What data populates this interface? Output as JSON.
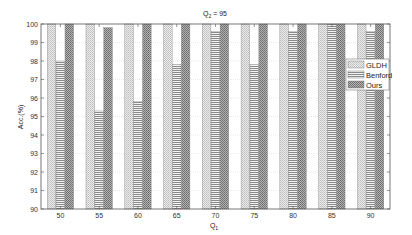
{
  "chart_data": {
    "type": "bar",
    "title": "Q2 = 95",
    "title_main": "Q",
    "title_sub": "2",
    "title_rest": " = 95",
    "xlabel": "Q1",
    "xlabel_main": "Q",
    "xlabel_sub": "1",
    "ylabel": "Acc.(%)",
    "categories": [
      "50",
      "55",
      "60",
      "65",
      "70",
      "75",
      "80",
      "85",
      "90"
    ],
    "series": [
      {
        "name": "GLDH",
        "pattern": "light-checker",
        "values": [
          100,
          100,
          100,
          100,
          100,
          100,
          100,
          100,
          100
        ]
      },
      {
        "name": "Benford",
        "pattern": "horizontal-lines",
        "values": [
          98.0,
          95.3,
          95.8,
          97.8,
          99.6,
          97.8,
          99.6,
          100,
          99.6
        ]
      },
      {
        "name": "Ours",
        "pattern": "dark-checker",
        "values": [
          100,
          99.8,
          100,
          100,
          100,
          100,
          100,
          100,
          100
        ]
      }
    ],
    "ylim": [
      90,
      100
    ],
    "yticks": [
      "90",
      "91",
      "92",
      "93",
      "94",
      "95",
      "96",
      "97",
      "98",
      "99",
      "100"
    ],
    "grid": true,
    "legend_position": "right-inside"
  },
  "colors": {
    "axis": "#555555",
    "grid": "#d6d6d6",
    "gldh_fill": "#d9d9d9",
    "benford_fill": "#bfbfbf",
    "ours_fill": "#9a9a9a"
  }
}
